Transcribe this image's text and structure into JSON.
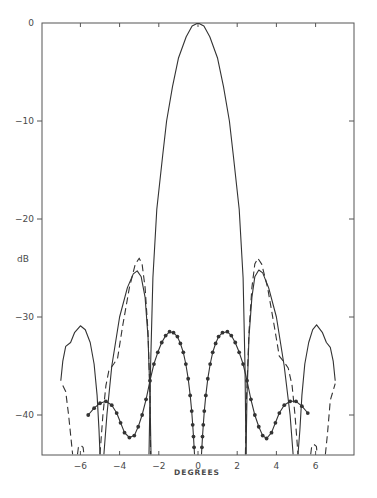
{
  "chart_data": {
    "type": "line",
    "title": "",
    "xlabel": "DEGREES",
    "ylabel": "dB",
    "xlim": [
      -7.1,
      7.9
    ],
    "ylim": [
      -44,
      0
    ],
    "grid": false,
    "legend": null,
    "x_ticks": [
      -6,
      -4,
      -2,
      0,
      2,
      4,
      6
    ],
    "x_tick_labels": [
      "-6",
      "-4",
      "-2",
      "0",
      "2",
      "4",
      "6"
    ],
    "y_ticks": [
      0,
      -10,
      -20,
      -30,
      -40
    ],
    "y_tick_labels": [
      "0",
      "-10",
      "-20",
      "-30",
      "-40"
    ],
    "series": [
      {
        "name": "solid pattern",
        "style": "solid",
        "segments": [
          [
            [
              -7.0,
              -36.5
            ],
            [
              -6.9,
              -34.5
            ],
            [
              -6.75,
              -33.0
            ],
            [
              -6.5,
              -32.6
            ],
            [
              -6.3,
              -31.6
            ],
            [
              -6.0,
              -30.9
            ],
            [
              -5.75,
              -31.3
            ],
            [
              -5.5,
              -32.6
            ],
            [
              -5.3,
              -34.8
            ],
            [
              -5.15,
              -38.0
            ],
            [
              -5.05,
              -41.5
            ],
            [
              -5.0,
              -44.0
            ]
          ],
          [
            [
              -4.8,
              -44.0
            ],
            [
              -4.65,
              -40.0
            ],
            [
              -4.4,
              -35.0
            ],
            [
              -4.0,
              -30.0
            ],
            [
              -3.6,
              -27.0
            ],
            [
              -3.3,
              -25.6
            ],
            [
              -3.1,
              -25.3
            ],
            [
              -2.9,
              -25.9
            ],
            [
              -2.7,
              -28.0
            ],
            [
              -2.55,
              -32.0
            ],
            [
              -2.45,
              -38.0
            ],
            [
              -2.4,
              -44.0
            ]
          ],
          [
            [
              -2.5,
              -44.0
            ],
            [
              -2.42,
              -35.0
            ],
            [
              -2.3,
              -26.0
            ],
            [
              -2.1,
              -19.0
            ],
            [
              -1.8,
              -13.5
            ],
            [
              -1.6,
              -10.0
            ],
            [
              -1.3,
              -6.5
            ],
            [
              -1.0,
              -3.6
            ],
            [
              -0.6,
              -1.4
            ],
            [
              -0.3,
              -0.3
            ],
            [
              0.0,
              0.0
            ],
            [
              0.3,
              -0.3
            ],
            [
              0.6,
              -1.4
            ],
            [
              1.0,
              -3.6
            ],
            [
              1.3,
              -6.5
            ],
            [
              1.6,
              -10.0
            ],
            [
              1.8,
              -13.5
            ],
            [
              2.1,
              -19.0
            ],
            [
              2.3,
              -26.0
            ],
            [
              2.4,
              -35.0
            ],
            [
              2.45,
              -44.0
            ]
          ],
          [
            [
              2.45,
              -44.0
            ],
            [
              2.5,
              -38.0
            ],
            [
              2.6,
              -32.0
            ],
            [
              2.75,
              -28.0
            ],
            [
              2.9,
              -25.9
            ],
            [
              3.1,
              -25.2
            ],
            [
              3.3,
              -25.5
            ],
            [
              3.6,
              -27.0
            ],
            [
              4.0,
              -30.0
            ],
            [
              4.4,
              -35.0
            ],
            [
              4.7,
              -40.0
            ],
            [
              4.85,
              -44.0
            ]
          ],
          [
            [
              5.1,
              -44.0
            ],
            [
              5.2,
              -41.5
            ],
            [
              5.3,
              -38.0
            ],
            [
              5.45,
              -34.8
            ],
            [
              5.65,
              -32.6
            ],
            [
              5.85,
              -31.3
            ],
            [
              6.05,
              -30.8
            ],
            [
              6.35,
              -31.6
            ],
            [
              6.55,
              -32.6
            ],
            [
              6.75,
              -33.1
            ],
            [
              6.9,
              -34.5
            ],
            [
              7.0,
              -36.5
            ]
          ]
        ]
      },
      {
        "name": "dashed pattern",
        "style": "dashed",
        "segments": [
          [
            [
              -6.9,
              -37.0
            ],
            [
              -6.75,
              -37.6
            ],
            [
              -6.6,
              -40.0
            ],
            [
              -6.45,
              -43.0
            ],
            [
              -6.4,
              -44.0
            ]
          ],
          [
            [
              -6.15,
              -44.0
            ],
            [
              -6.1,
              -43.3
            ],
            [
              -5.98,
              -43.1
            ],
            [
              -5.86,
              -43.3
            ],
            [
              -5.82,
              -44.0
            ]
          ],
          [
            [
              -5.0,
              -44.0
            ],
            [
              -4.85,
              -40.0
            ],
            [
              -4.7,
              -37.0
            ],
            [
              -4.55,
              -35.5
            ],
            [
              -4.3,
              -34.8
            ],
            [
              -4.1,
              -34.2
            ],
            [
              -3.85,
              -31.0
            ],
            [
              -3.5,
              -27.0
            ],
            [
              -3.2,
              -24.6
            ],
            [
              -3.0,
              -24.0
            ],
            [
              -2.85,
              -24.6
            ],
            [
              -2.7,
              -27.0
            ],
            [
              -2.55,
              -31.5
            ],
            [
              -2.45,
              -38.0
            ],
            [
              -2.42,
              -44.0
            ]
          ],
          [
            [
              2.42,
              -44.0
            ],
            [
              2.48,
              -38.0
            ],
            [
              2.6,
              -31.5
            ],
            [
              2.75,
              -27.0
            ],
            [
              2.9,
              -24.6
            ],
            [
              3.05,
              -24.0
            ],
            [
              3.25,
              -24.6
            ],
            [
              3.55,
              -27.0
            ],
            [
              3.9,
              -31.0
            ],
            [
              4.15,
              -34.0
            ],
            [
              4.4,
              -34.6
            ],
            [
              4.6,
              -35.2
            ],
            [
              4.8,
              -37.0
            ],
            [
              4.95,
              -40.0
            ],
            [
              5.1,
              -44.0
            ]
          ],
          [
            [
              5.75,
              -44.0
            ],
            [
              5.8,
              -43.2
            ],
            [
              5.92,
              -43.0
            ],
            [
              6.04,
              -43.2
            ],
            [
              6.08,
              -44.0
            ]
          ],
          [
            [
              6.5,
              -44.0
            ],
            [
              6.6,
              -42.0
            ],
            [
              6.75,
              -38.5
            ],
            [
              6.9,
              -37.5
            ],
            [
              7.0,
              -36.8
            ]
          ]
        ]
      },
      {
        "name": "dotted-marker pattern",
        "style": "solid-with-markers",
        "segments": [
          [
            [
              -5.6,
              -40.0
            ],
            [
              -5.3,
              -39.3
            ],
            [
              -5.0,
              -38.8
            ],
            [
              -4.7,
              -38.6
            ],
            [
              -4.4,
              -39.0
            ],
            [
              -4.15,
              -39.8
            ],
            [
              -3.95,
              -40.8
            ],
            [
              -3.75,
              -41.8
            ],
            [
              -3.5,
              -42.3
            ],
            [
              -3.25,
              -42.1
            ],
            [
              -3.05,
              -41.2
            ],
            [
              -2.85,
              -40.0
            ],
            [
              -2.65,
              -38.4
            ],
            [
              -2.45,
              -36.5
            ],
            [
              -2.25,
              -34.8
            ],
            [
              -2.05,
              -33.6
            ],
            [
              -1.85,
              -32.6
            ],
            [
              -1.65,
              -31.9
            ],
            [
              -1.45,
              -31.5
            ],
            [
              -1.25,
              -31.6
            ],
            [
              -1.05,
              -32.0
            ],
            [
              -0.9,
              -32.7
            ],
            [
              -0.75,
              -33.6
            ],
            [
              -0.62,
              -34.8
            ],
            [
              -0.5,
              -36.3
            ],
            [
              -0.4,
              -38.0
            ],
            [
              -0.32,
              -39.6
            ],
            [
              -0.27,
              -41.0
            ],
            [
              -0.23,
              -42.2
            ],
            [
              -0.2,
              -43.3
            ],
            [
              -0.18,
              -44.0
            ]
          ],
          [
            [
              0.18,
              -44.0
            ],
            [
              0.2,
              -43.3
            ],
            [
              0.23,
              -42.2
            ],
            [
              0.27,
              -41.0
            ],
            [
              0.32,
              -39.6
            ],
            [
              0.4,
              -38.0
            ],
            [
              0.5,
              -36.3
            ],
            [
              0.62,
              -34.8
            ],
            [
              0.75,
              -33.6
            ],
            [
              0.9,
              -32.7
            ],
            [
              1.05,
              -32.0
            ],
            [
              1.25,
              -31.6
            ],
            [
              1.5,
              -31.5
            ],
            [
              1.7,
              -31.9
            ],
            [
              1.9,
              -32.6
            ],
            [
              2.1,
              -33.6
            ],
            [
              2.3,
              -34.8
            ],
            [
              2.5,
              -36.5
            ],
            [
              2.7,
              -38.4
            ],
            [
              2.9,
              -40.0
            ],
            [
              3.1,
              -41.2
            ],
            [
              3.3,
              -42.1
            ],
            [
              3.5,
              -42.4
            ],
            [
              3.75,
              -41.8
            ],
            [
              3.95,
              -40.8
            ],
            [
              4.15,
              -39.8
            ],
            [
              4.4,
              -39.0
            ],
            [
              4.7,
              -38.6
            ],
            [
              5.0,
              -38.6
            ],
            [
              5.3,
              -39.1
            ],
            [
              5.6,
              -39.8
            ]
          ]
        ]
      }
    ]
  },
  "labels": {
    "y_axis_title": "dB",
    "x_axis_title": "DEGREES"
  }
}
